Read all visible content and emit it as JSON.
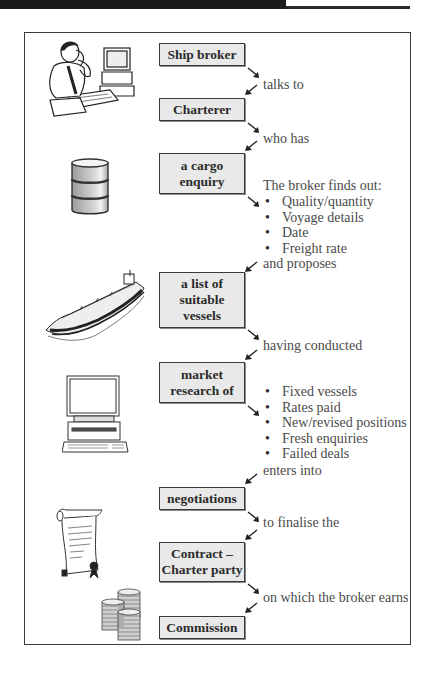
{
  "diagram": {
    "type": "flowchart",
    "colors": {
      "box_fill": "#e9e9e9",
      "box_border": "#3a3a3a",
      "frame_border": "#3c3c3c",
      "text": "#4a4a4a",
      "header_bar": "#1b1b1b"
    },
    "nodes": [
      {
        "id": "ship_broker",
        "label": "Ship broker",
        "illustration": "broker-at-computer-icon"
      },
      {
        "id": "charterer",
        "label": "Charterer"
      },
      {
        "id": "cargo_enquiry",
        "label": "a cargo enquiry",
        "line1": "a cargo",
        "line2": "enquiry",
        "illustration": "oil-barrel-icon"
      },
      {
        "id": "vessels",
        "label": "a list of suitable vessels",
        "line1": "a list of",
        "line2": "suitable",
        "line3": "vessels",
        "illustration": "tanker-ship-icon"
      },
      {
        "id": "market_research",
        "label": "market research of",
        "line1": "market",
        "line2": "research of",
        "illustration": "desktop-computer-icon"
      },
      {
        "id": "negotiations",
        "label": "negotiations"
      },
      {
        "id": "contract",
        "label": "Contract – Charter party",
        "line1": "Contract –",
        "line2": "Charter party",
        "illustration": "scroll-document-icon"
      },
      {
        "id": "commission",
        "label": "Commission",
        "illustration": "coin-stacks-icon"
      }
    ],
    "edges": [
      {
        "from": "ship_broker",
        "to": "charterer",
        "label": "talks to"
      },
      {
        "from": "charterer",
        "to": "cargo_enquiry",
        "label": "who has"
      },
      {
        "from": "cargo_enquiry",
        "to": "vessels",
        "label": "and proposes"
      },
      {
        "from": "vessels",
        "to": "market_research",
        "label": "having conducted"
      },
      {
        "from": "market_research",
        "to": "negotiations",
        "label": "enters into"
      },
      {
        "from": "negotiations",
        "to": "contract",
        "label": "to finalise the"
      },
      {
        "from": "contract",
        "to": "commission",
        "label": "on which the broker earns"
      }
    ],
    "notes": {
      "broker_finds_out": {
        "heading": "The broker finds out:",
        "items": [
          "Quality/quantity",
          "Voyage details",
          "Date",
          "Freight rate"
        ]
      },
      "research_items": [
        "Fixed vessels",
        "Rates paid",
        "New/revised positions",
        "Fresh enquiries",
        "Failed deals"
      ]
    }
  }
}
